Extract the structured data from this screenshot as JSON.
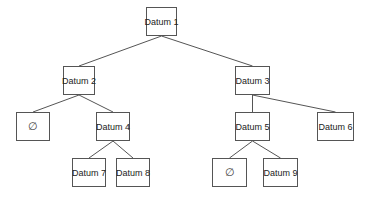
{
  "diagram": {
    "type": "binary-tree",
    "line_color": "#555555",
    "nodes": [
      {
        "id": "d1",
        "label": "Datum 1",
        "x": 146,
        "y": 7,
        "w": 31,
        "h": 29
      },
      {
        "id": "d2",
        "label": "Datum 2",
        "x": 63,
        "y": 66,
        "w": 32,
        "h": 29
      },
      {
        "id": "d3",
        "label": "Datum 3",
        "x": 235,
        "y": 66,
        "w": 35,
        "h": 29
      },
      {
        "id": "n1",
        "label": "∅",
        "x": 16,
        "y": 112,
        "w": 34,
        "h": 29,
        "null": true
      },
      {
        "id": "d4",
        "label": "Datum 4",
        "x": 96,
        "y": 112,
        "w": 34,
        "h": 29
      },
      {
        "id": "d5",
        "label": "Datum 5",
        "x": 235,
        "y": 112,
        "w": 35,
        "h": 29
      },
      {
        "id": "d6",
        "label": "Datum 6",
        "x": 317,
        "y": 112,
        "w": 37,
        "h": 29
      },
      {
        "id": "d7",
        "label": "Datum 7",
        "x": 72,
        "y": 158,
        "w": 34,
        "h": 29
      },
      {
        "id": "d8",
        "label": "Datum 8",
        "x": 116,
        "y": 158,
        "w": 34,
        "h": 29
      },
      {
        "id": "n2",
        "label": "∅",
        "x": 212,
        "y": 158,
        "w": 35,
        "h": 29,
        "null": true
      },
      {
        "id": "d9",
        "label": "Datum 9",
        "x": 263,
        "y": 158,
        "w": 35,
        "h": 29
      }
    ],
    "edges": [
      {
        "from": "d1",
        "to": "d2"
      },
      {
        "from": "d1",
        "to": "d3"
      },
      {
        "from": "d2",
        "to": "n1"
      },
      {
        "from": "d2",
        "to": "d4"
      },
      {
        "from": "d3",
        "to": "d5"
      },
      {
        "from": "d3",
        "to": "d6"
      },
      {
        "from": "d4",
        "to": "d7"
      },
      {
        "from": "d4",
        "to": "d8"
      },
      {
        "from": "d5",
        "to": "n2"
      },
      {
        "from": "d5",
        "to": "d9"
      }
    ]
  }
}
